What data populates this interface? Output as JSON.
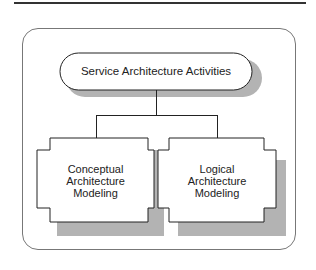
{
  "diagram": {
    "root": {
      "label": "Service Architecture Activities"
    },
    "children": [
      {
        "label_lines": [
          "Conceptual",
          "Architecture",
          "Modeling"
        ]
      },
      {
        "label_lines": [
          "Logical",
          "Architecture",
          "Modeling"
        ]
      }
    ]
  },
  "colors": {
    "line": "#222222",
    "shadow": "#b3b3b3",
    "frame": "#777777"
  }
}
